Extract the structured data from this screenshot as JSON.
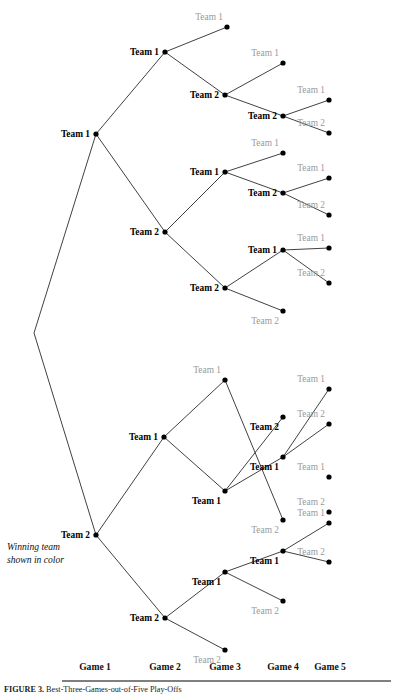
{
  "figure": {
    "legend_note_line1": "Winning team",
    "legend_note_line2": "shown in color",
    "caption_label": "FIGURE 3.",
    "caption_text": "Best-Three-Games-out-of-Five Play-Offs",
    "winner_color": "#000000",
    "loser_color": "#9a9a9a",
    "edge_color": "#2b2b2b"
  },
  "axis": {
    "labels": [
      {
        "text": "Game 1",
        "x": 95
      },
      {
        "text": "Game 2",
        "x": 165
      },
      {
        "text": "Game 3",
        "x": 225
      },
      {
        "text": "Game 4",
        "x": 283
      },
      {
        "text": "Game 5",
        "x": 330
      }
    ],
    "y": 670,
    "rule_y": 681,
    "rule_x1": 62,
    "rule_x2": 391
  },
  "chart_data": {
    "type": "tree",
    "title": "Best-Three-Games-out-of-Five Play-Offs",
    "rounds": [
      "Game 1",
      "Game 2",
      "Game 3",
      "Game 4",
      "Game 5"
    ],
    "root": {
      "x": 34,
      "y": 333
    },
    "nodes": [
      {
        "id": "g1a",
        "x": 96,
        "y": 134,
        "label": "Team 1",
        "winner": true,
        "side": "left",
        "round": 1
      },
      {
        "id": "g1b",
        "x": 96,
        "y": 535,
        "label": "Team 2",
        "winner": true,
        "side": "left",
        "round": 1
      },
      {
        "id": "g2a",
        "x": 165,
        "y": 52,
        "label": "Team 1",
        "winner": true,
        "side": "left",
        "round": 2
      },
      {
        "id": "g2b",
        "x": 165,
        "y": 232,
        "label": "Team 2",
        "winner": true,
        "side": "left",
        "round": 2
      },
      {
        "id": "g2c",
        "x": 164,
        "y": 437,
        "label": "Team 1",
        "winner": true,
        "side": "left",
        "round": 2
      },
      {
        "id": "g2d",
        "x": 165,
        "y": 618,
        "label": "Team 2",
        "winner": true,
        "side": "left",
        "round": 2
      },
      {
        "id": "g3a",
        "x": 227,
        "y": 27,
        "label": "Team 1",
        "winner": false,
        "side": "above",
        "round": 3
      },
      {
        "id": "g3b",
        "x": 225,
        "y": 95,
        "label": "Team 2",
        "winner": true,
        "side": "left",
        "round": 3
      },
      {
        "id": "g3c",
        "x": 225,
        "y": 172,
        "label": "Team 1",
        "winner": true,
        "side": "left",
        "round": 3
      },
      {
        "id": "g3d",
        "x": 225,
        "y": 288,
        "label": "Team 2",
        "winner": true,
        "side": "left",
        "round": 3
      },
      {
        "id": "g3e",
        "x": 225,
        "y": 380,
        "label": "Team 1",
        "winner": false,
        "side": "above",
        "round": 3
      },
      {
        "id": "g3f",
        "x": 225,
        "y": 491,
        "label": "Team 1",
        "winner": true,
        "side": "below",
        "round": 3
      },
      {
        "id": "g3g",
        "x": 225,
        "y": 572,
        "label": "Team 1",
        "winner": true,
        "side": "below",
        "round": 3
      },
      {
        "id": "g3h",
        "x": 225,
        "y": 650,
        "label": "Team 2",
        "winner": false,
        "side": "below",
        "round": 3
      },
      {
        "id": "g4a",
        "x": 283,
        "y": 63,
        "label": "Team 1",
        "winner": false,
        "side": "above",
        "round": 4
      },
      {
        "id": "g4b",
        "x": 283,
        "y": 116,
        "label": "Team 2",
        "winner": true,
        "side": "left",
        "round": 4
      },
      {
        "id": "g4c",
        "x": 283,
        "y": 153,
        "label": "Team 1",
        "winner": false,
        "side": "above",
        "round": 4
      },
      {
        "id": "g4d",
        "x": 283,
        "y": 193,
        "label": "Team 2",
        "winner": true,
        "side": "left",
        "round": 4
      },
      {
        "id": "g4e",
        "x": 283,
        "y": 250,
        "label": "Team 1",
        "winner": true,
        "side": "left",
        "round": 4
      },
      {
        "id": "g4f",
        "x": 283,
        "y": 311,
        "label": "Team 2",
        "winner": false,
        "side": "below",
        "round": 4
      },
      {
        "id": "g4g",
        "x": 283,
        "y": 417,
        "label": "Team 2",
        "winner": true,
        "side": "below",
        "round": 4
      },
      {
        "id": "g4h",
        "x": 283,
        "y": 457,
        "label": "Team 1",
        "winner": true,
        "side": "below",
        "round": 4
      },
      {
        "id": "g4i",
        "x": 283,
        "y": 520,
        "label": "Team 2",
        "winner": false,
        "side": "below",
        "round": 4
      },
      {
        "id": "g4j",
        "x": 283,
        "y": 551,
        "label": "Team 1",
        "winner": true,
        "side": "below",
        "round": 4
      },
      {
        "id": "g4k",
        "x": 283,
        "y": 601,
        "label": "Team 2",
        "winner": false,
        "side": "below",
        "round": 4
      },
      {
        "id": "g5a",
        "x": 329,
        "y": 100,
        "label": "Team 1",
        "winner": false,
        "side": "above",
        "round": 5
      },
      {
        "id": "g5b",
        "x": 329,
        "y": 133,
        "label": "Team 2",
        "winner": false,
        "side": "above",
        "round": 5
      },
      {
        "id": "g5c",
        "x": 329,
        "y": 178,
        "label": "Team 1",
        "winner": false,
        "side": "above",
        "round": 5
      },
      {
        "id": "g5d",
        "x": 329,
        "y": 215,
        "label": "Team 2",
        "winner": false,
        "side": "above",
        "round": 5
      },
      {
        "id": "g5e",
        "x": 329,
        "y": 248,
        "label": "Team 1",
        "winner": false,
        "side": "above",
        "round": 5
      },
      {
        "id": "g5f",
        "x": 329,
        "y": 283,
        "label": "Team 2",
        "winner": false,
        "side": "above",
        "round": 5
      },
      {
        "id": "g5g",
        "x": 329,
        "y": 389,
        "label": "Team 1",
        "winner": false,
        "side": "above",
        "round": 5
      },
      {
        "id": "g5h",
        "x": 329,
        "y": 424,
        "label": "Team 2",
        "winner": false,
        "side": "above",
        "round": 5
      },
      {
        "id": "g5i",
        "x": 329,
        "y": 477,
        "label": "Team 1",
        "winner": false,
        "side": "above",
        "round": 5
      },
      {
        "id": "g5j",
        "x": 329,
        "y": 512,
        "label": "Team 2",
        "winner": false,
        "side": "above",
        "round": 5
      },
      {
        "id": "g5k",
        "x": 329,
        "y": 523,
        "label": "Team 1",
        "winner": false,
        "side": "above",
        "round": 5
      },
      {
        "id": "g5l",
        "x": 329,
        "y": 562,
        "label": "Team 2",
        "winner": false,
        "side": "above",
        "round": 5
      }
    ],
    "edges": [
      [
        "root",
        "g1a"
      ],
      [
        "root",
        "g1b"
      ],
      [
        "g1a",
        "g2a"
      ],
      [
        "g1a",
        "g2b"
      ],
      [
        "g1b",
        "g2c"
      ],
      [
        "g1b",
        "g2d"
      ],
      [
        "g2a",
        "g3a"
      ],
      [
        "g2a",
        "g3b"
      ],
      [
        "g2b",
        "g3c"
      ],
      [
        "g2b",
        "g3d"
      ],
      [
        "g2c",
        "g3e"
      ],
      [
        "g2c",
        "g3f"
      ],
      [
        "g2d",
        "g3g"
      ],
      [
        "g2d",
        "g3h"
      ],
      [
        "g3b",
        "g4a"
      ],
      [
        "g3b",
        "g4b"
      ],
      [
        "g3c",
        "g4c"
      ],
      [
        "g3c",
        "g4d"
      ],
      [
        "g3d",
        "g4e"
      ],
      [
        "g3d",
        "g4f"
      ],
      [
        "g3f",
        "g4g"
      ],
      [
        "g3f",
        "g4h"
      ],
      [
        "g3g",
        "g4j"
      ],
      [
        "g3g",
        "g4k"
      ],
      [
        "g3e",
        "g4i"
      ],
      [
        "g4b",
        "g5a"
      ],
      [
        "g4b",
        "g5b"
      ],
      [
        "g4d",
        "g5c"
      ],
      [
        "g4d",
        "g5d"
      ],
      [
        "g4e",
        "g5e"
      ],
      [
        "g4e",
        "g5f"
      ],
      [
        "g4h",
        "g5g"
      ],
      [
        "g4h",
        "g5h"
      ],
      [
        "g4j",
        "g5k"
      ],
      [
        "g4j",
        "g5l"
      ]
    ]
  }
}
